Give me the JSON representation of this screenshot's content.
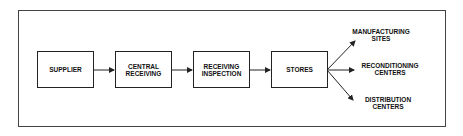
{
  "diagram": {
    "nodes": [
      {
        "id": "supplier",
        "label": "SUPPLIER"
      },
      {
        "id": "central",
        "label": "CENTRAL RECEIVING"
      },
      {
        "id": "inspection",
        "label": "RECEIVING INSPECTION"
      },
      {
        "id": "stores",
        "label": "STORES"
      }
    ],
    "outputs": [
      {
        "id": "manufacturing",
        "label": "MANUFACTURING SITES"
      },
      {
        "id": "reconditioning",
        "label": "RECONDITIONING CENTERS"
      },
      {
        "id": "distribution",
        "label": "DISTRIBUTION CENTERS"
      }
    ],
    "edges": [
      [
        "supplier",
        "central"
      ],
      [
        "central",
        "inspection"
      ],
      [
        "inspection",
        "stores"
      ],
      [
        "stores",
        "manufacturing"
      ],
      [
        "stores",
        "reconditioning"
      ],
      [
        "stores",
        "distribution"
      ]
    ]
  }
}
